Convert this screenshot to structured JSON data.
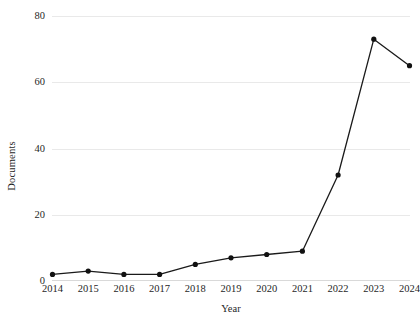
{
  "chart_data": {
    "type": "line",
    "title": "",
    "subtitle": "",
    "xlabel": "Year",
    "ylabel": "Documents",
    "categories": [
      "2014",
      "2015",
      "2016",
      "2017",
      "2018",
      "2019",
      "2020",
      "2021",
      "2022",
      "2023",
      "2024"
    ],
    "x": [
      2014,
      2015,
      2016,
      2017,
      2018,
      2019,
      2020,
      2021,
      2022,
      2023,
      2024
    ],
    "values": [
      2,
      3,
      2,
      2,
      5,
      7,
      8,
      9,
      32,
      73,
      65
    ],
    "series": [
      {
        "name": "Documents",
        "values": [
          2,
          3,
          2,
          2,
          5,
          7,
          8,
          9,
          32,
          73,
          65
        ]
      }
    ],
    "ylim": [
      0,
      80
    ],
    "yticks": [
      0,
      20,
      40,
      60,
      80
    ],
    "ytick_labels": [
      "0",
      "20",
      "40",
      "60",
      "80"
    ],
    "xlim": [
      2014,
      2024
    ],
    "grid": "horizontal",
    "legend": "none",
    "annotations": [],
    "colors": {
      "line": "#1a1a1a",
      "marker": "#111111",
      "gridline": "#e9e9e9",
      "axis": "#d9d9d9",
      "text": "#1f1f1f",
      "background": "#ffffff"
    },
    "marker_style": "filled-circle"
  }
}
